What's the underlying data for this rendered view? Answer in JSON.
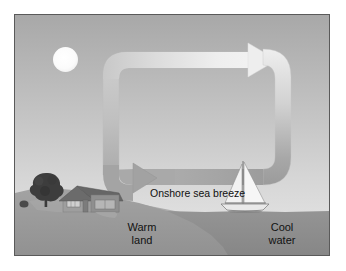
{
  "figure": {
    "border_color": "#5a5a5a",
    "background": "#ffffff"
  },
  "labels": {
    "breeze": "Onshore sea breeze",
    "warm_land": "Warm\nland",
    "cool_water": "Cool\nwater"
  },
  "colors": {
    "sky_top": "#a8a8a8",
    "sky_bottom": "#e2e2e2",
    "land": "#9a9a9a",
    "land_far": "#a6a6a6",
    "water": "#8e8e8e",
    "sun": "#ffffff",
    "arrow_light": "#e4e4e4",
    "arrow_dark": "#9b9b9b",
    "tree": "#3a3a3a",
    "house_roof": "#6e6e6e",
    "house_wall": "#9c9c9c",
    "boat_sail": "#f4f4f4",
    "text": "#121212"
  },
  "elements": {
    "sun": "sun-icon",
    "tree": "tree-icon",
    "house": "house-icon",
    "sailboat": "sailboat-icon",
    "circulation_loop": "circulation-arrow-loop",
    "top_arrow_direction": "right",
    "bottom_arrow_direction": "left"
  }
}
